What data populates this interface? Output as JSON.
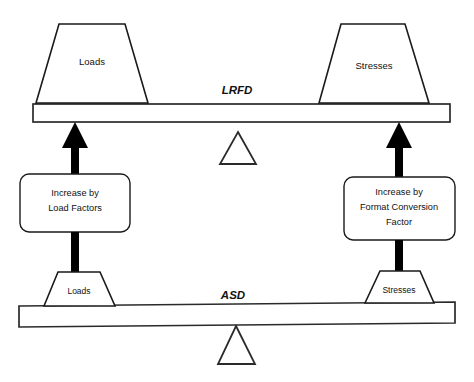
{
  "diagram": {
    "colors": {
      "stroke": "#1a1a1a",
      "fill": "#ffffff",
      "arrow": "#000000",
      "background": "#ffffff"
    },
    "lrfd": {
      "method_label": "LRFD",
      "left_block_label": "Loads",
      "right_block_label": "Stresses"
    },
    "asd": {
      "method_label": "ASD",
      "left_block_label": "Loads",
      "right_block_label": "Stresses"
    },
    "conversions": {
      "left": {
        "line1": "Increase by",
        "line2": "Load Factors",
        "line3": ""
      },
      "right": {
        "line1": "Increase by",
        "line2": "Format Conversion",
        "line3": "Factor"
      }
    }
  }
}
